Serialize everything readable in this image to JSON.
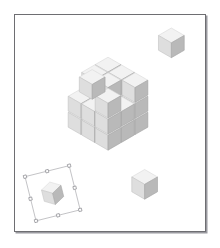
{
  "page": {
    "title": "Exploded Cube Illustration",
    "background_color": "#ffffff",
    "width": 220,
    "height": 248
  },
  "frame": {
    "name": "illustration-frame",
    "border_color": "#6e6e72",
    "shadow_color": "#9a9aa0",
    "fill_color": "#ffffff",
    "x": 14,
    "y": 14,
    "width": 192,
    "height": 218
  },
  "palette": {
    "face_top": "#f2f2f2",
    "face_left": "#dedede",
    "face_right": "#b9b9b9",
    "edge_top": "#d8d8d8",
    "edge_left": "#c2c2c2",
    "edge_right": "#a2a2a2",
    "selection_outline": "#b9b9bd",
    "selection_handle_fill": "#ffffff",
    "selection_handle_stroke": "#8d8d92",
    "gap_color": "#ffffff"
  },
  "scene": {
    "name": "exploded-cube-scene",
    "description": "Isometric 3x3 cube with detached cubelets",
    "projection": "isometric",
    "cube_size": 3,
    "detached_count": 3,
    "unit": {
      "half_width": 13,
      "half_height": 7.5,
      "side_height": 15
    },
    "origin": {
      "x": 108,
      "y": 104
    },
    "stack_cells": [
      {
        "i": 0,
        "j": 0,
        "k": 0
      },
      {
        "i": 1,
        "j": 0,
        "k": 0
      },
      {
        "i": 2,
        "j": 0,
        "k": 0
      },
      {
        "i": 0,
        "j": 1,
        "k": 0
      },
      {
        "i": 1,
        "j": 1,
        "k": 0
      },
      {
        "i": 2,
        "j": 1,
        "k": 0
      },
      {
        "i": 0,
        "j": 2,
        "k": 0
      },
      {
        "i": 1,
        "j": 2,
        "k": 0
      },
      {
        "i": 2,
        "j": 2,
        "k": 0
      },
      {
        "i": 0,
        "j": 0,
        "k": 1
      },
      {
        "i": 1,
        "j": 0,
        "k": 1
      },
      {
        "i": 2,
        "j": 0,
        "k": 1
      },
      {
        "i": 0,
        "j": 1,
        "k": 1
      },
      {
        "i": 1,
        "j": 1,
        "k": 1
      },
      {
        "i": 2,
        "j": 1,
        "k": 1
      },
      {
        "i": 0,
        "j": 2,
        "k": 1
      },
      {
        "i": 1,
        "j": 2,
        "k": 1
      },
      {
        "i": 2,
        "j": 2,
        "k": 1
      },
      {
        "i": 0,
        "j": 0,
        "k": 2
      },
      {
        "i": 1,
        "j": 0,
        "k": 2
      },
      {
        "i": 2,
        "j": 0,
        "k": 2
      },
      {
        "i": 0,
        "j": 1,
        "k": 2
      },
      {
        "i": 1,
        "j": 1,
        "k": 2
      },
      {
        "i": 2,
        "j": 2,
        "k": 2
      }
    ],
    "detached_cubelets": [
      {
        "name": "detached-cube-top-right",
        "cx": 172,
        "cy": 42,
        "scale": 1.0
      },
      {
        "name": "detached-cube-left",
        "cx": 92,
        "cy": 84,
        "scale": 1.0
      },
      {
        "name": "detached-cube-bottom",
        "cx": 145,
        "cy": 185,
        "scale": 1.0
      }
    ]
  },
  "selected_object": {
    "name": "selected-cube",
    "label": "",
    "cx": 52,
    "cy": 194,
    "scale": 0.78,
    "rotation_deg": -14,
    "selection_box": {
      "width": 46,
      "height": 46,
      "handle_size": 3,
      "handle_count": 8
    }
  }
}
